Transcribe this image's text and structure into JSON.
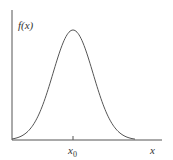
{
  "chart_data": {
    "type": "line",
    "title": "",
    "xlabel": "x",
    "ylabel": "f(x)",
    "x_ticks": [
      {
        "label": "x0",
        "position": "x0"
      }
    ],
    "series": [
      {
        "name": "f(x)",
        "shape": "gaussian",
        "peak_at": "x0",
        "x": [
          -3,
          -2.5,
          -2,
          -1.5,
          -1,
          -0.5,
          0,
          0.5,
          1,
          1.5,
          2,
          2.5,
          3
        ],
        "values": [
          0.011,
          0.044,
          0.135,
          0.325,
          0.607,
          0.882,
          1.0,
          0.882,
          0.607,
          0.325,
          0.135,
          0.044,
          0.011
        ]
      }
    ],
    "grid": false,
    "legend": "none",
    "colors": {
      "curve": "#555555",
      "axes": "#555555"
    }
  },
  "labels": {
    "y_axis": "f(x)",
    "x_axis": "x",
    "tick_main": "x",
    "tick_sub": "0"
  }
}
